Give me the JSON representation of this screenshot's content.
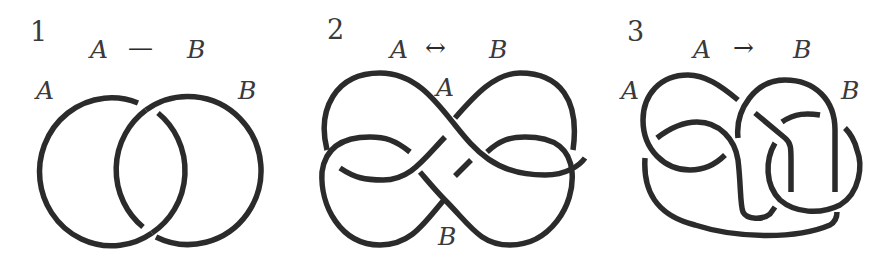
{
  "panels": [
    {
      "number": "1",
      "relation": {
        "left": "A",
        "symbol": "—",
        "right": "B",
        "meaning": "mutual-linked"
      },
      "labels": {
        "left": "A",
        "right": "B"
      },
      "figure": "hopf-link"
    },
    {
      "number": "2",
      "relation": {
        "left": "A",
        "symbol": "↔",
        "right": "B",
        "meaning": "bidirectional"
      },
      "labels": {
        "top": "A",
        "bottom": "B"
      },
      "figure": "interlaced-double-loop"
    },
    {
      "number": "3",
      "relation": {
        "left": "A",
        "symbol": "→",
        "right": "B",
        "meaning": "directed"
      },
      "labels": {
        "left": "A",
        "right": "B"
      },
      "figure": "knotted-loops"
    }
  ],
  "colors": {
    "stroke": "#2b2b2b",
    "text": "#3a3a3a",
    "background": "#ffffff"
  }
}
